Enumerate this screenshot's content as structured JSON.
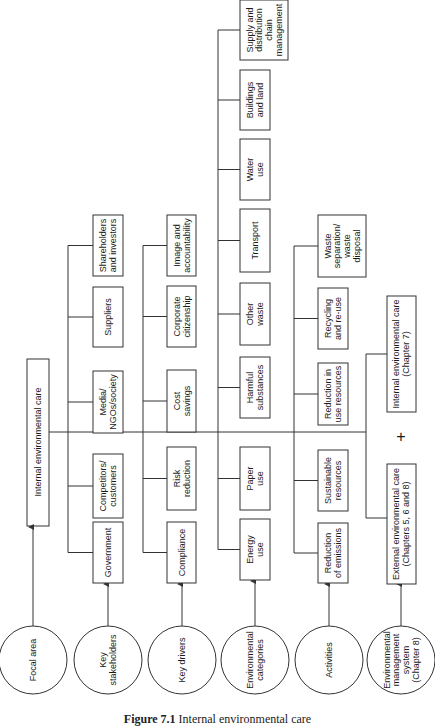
{
  "caption": {
    "number": "Figure 7.1",
    "title": "Internal environmental care"
  },
  "focal_area": {
    "circle_label": [
      "Focal area"
    ],
    "box_label": [
      "Internal environmental care"
    ]
  },
  "rows": [
    {
      "id": "key-stakeholders",
      "circle_label": [
        "Key",
        "stakeholders"
      ],
      "items": [
        [
          "Government"
        ],
        [
          "Competitors/",
          "customers"
        ],
        [
          "Media/",
          "NGOs/society"
        ],
        [
          "Suppliers"
        ],
        [
          "Shareholders",
          "and investors"
        ]
      ]
    },
    {
      "id": "key-drivers",
      "circle_label": [
        "Key drivers"
      ],
      "items": [
        [
          "Compliance"
        ],
        [
          "Risk",
          "reduction"
        ],
        [
          "Cost",
          "savings"
        ],
        [
          "Corporate",
          "citizenship"
        ],
        [
          "Image and",
          "accountability"
        ]
      ]
    },
    {
      "id": "environmental-categories",
      "circle_label": [
        "Environmental",
        "categories"
      ],
      "items": [
        [
          "Energy",
          "use"
        ],
        [
          "Paper",
          "use"
        ],
        [
          "Harmful",
          "substances"
        ],
        [
          "Other",
          "waste"
        ],
        [
          "Transport"
        ],
        [
          "Water",
          "use"
        ],
        [
          "Buildings",
          "and land"
        ],
        [
          "Supply and",
          "distribution",
          "chain",
          "management"
        ]
      ]
    },
    {
      "id": "activities",
      "circle_label": [
        "Activities"
      ],
      "items": [
        [
          "Reduction",
          "of emissions"
        ],
        [
          "Sustainable",
          "resources"
        ],
        [
          "Reduction in",
          "use resources"
        ],
        [
          "Recycling",
          "and re-use"
        ],
        [
          "Waste",
          "separation/",
          "waste",
          "disposal"
        ]
      ]
    },
    {
      "id": "environmental-management-system",
      "circle_label": [
        "Environmental",
        "management",
        "system",
        "(Chapter 8)"
      ],
      "items": [
        [
          "External environmental care",
          "(Chapters 5, 6 and 8)"
        ],
        [
          "Internal environmental care",
          "(Chapter 7)"
        ]
      ],
      "connector": "+"
    }
  ]
}
